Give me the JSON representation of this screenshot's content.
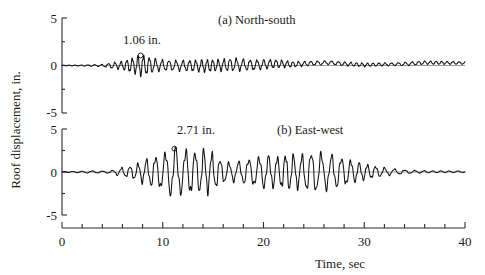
{
  "figure": {
    "y_axis_title": "Roof displacement, in.",
    "x_axis_title": "Time, sec"
  },
  "chart_data": {
    "type": "line",
    "title": "",
    "xlabel": "Time, sec",
    "ylabel": "Roof displacement, in.",
    "xlim": [
      0,
      40
    ],
    "ylim": [
      -5,
      5
    ],
    "xticks": [
      0,
      10,
      20,
      30,
      40
    ],
    "xtick_labels": [
      "0",
      "10",
      "20",
      "30",
      "40"
    ],
    "xminor_step": 2,
    "yticks": [
      -5,
      0,
      5
    ],
    "ytick_labels": [
      "-5",
      "0",
      "5"
    ],
    "yminor_step": 2.5,
    "grid": false,
    "legend": "none",
    "panels": [
      {
        "id": "panel-a",
        "title": "(a) North-south",
        "annotation": {
          "text": "1.06 in.",
          "peak_time": 7.8,
          "peak_value": 1.06,
          "marker": "open-circle"
        },
        "envelope": [
          {
            "t": 0.0,
            "a": 0.03
          },
          {
            "t": 2.0,
            "a": 0.05
          },
          {
            "t": 4.0,
            "a": 0.1
          },
          {
            "t": 5.0,
            "a": 0.28
          },
          {
            "t": 6.0,
            "a": 0.4
          },
          {
            "t": 7.0,
            "a": 0.72
          },
          {
            "t": 7.8,
            "a": 1.06
          },
          {
            "t": 8.6,
            "a": 0.82
          },
          {
            "t": 9.5,
            "a": 0.55
          },
          {
            "t": 11.0,
            "a": 0.48
          },
          {
            "t": 12.5,
            "a": 0.52
          },
          {
            "t": 14.0,
            "a": 0.6
          },
          {
            "t": 15.5,
            "a": 0.55
          },
          {
            "t": 17.0,
            "a": 0.62
          },
          {
            "t": 18.5,
            "a": 0.5
          },
          {
            "t": 20.0,
            "a": 0.45
          },
          {
            "t": 21.5,
            "a": 0.38
          },
          {
            "t": 23.0,
            "a": 0.26
          },
          {
            "t": 25.0,
            "a": 0.2
          },
          {
            "t": 27.0,
            "a": 0.17
          },
          {
            "t": 29.0,
            "a": 0.19
          },
          {
            "t": 31.0,
            "a": 0.16
          },
          {
            "t": 33.0,
            "a": 0.14
          },
          {
            "t": 35.0,
            "a": 0.17
          },
          {
            "t": 37.0,
            "a": 0.15
          },
          {
            "t": 40.0,
            "a": 0.12
          }
        ],
        "drift": [
          {
            "t": 0.0,
            "d": 0.0
          },
          {
            "t": 5.0,
            "d": 0.0
          },
          {
            "t": 10.0,
            "d": 0.02
          },
          {
            "t": 14.0,
            "d": -0.05
          },
          {
            "t": 17.0,
            "d": 0.1
          },
          {
            "t": 19.0,
            "d": 0.04
          },
          {
            "t": 21.0,
            "d": 0.18
          },
          {
            "t": 23.0,
            "d": 0.12
          },
          {
            "t": 25.0,
            "d": 0.24
          },
          {
            "t": 26.5,
            "d": 0.3
          },
          {
            "t": 28.0,
            "d": 0.18
          },
          {
            "t": 30.0,
            "d": 0.06
          },
          {
            "t": 32.0,
            "d": 0.12
          },
          {
            "t": 34.0,
            "d": 0.16
          },
          {
            "t": 36.0,
            "d": 0.3
          },
          {
            "t": 38.0,
            "d": 0.28
          },
          {
            "t": 40.0,
            "d": 0.26
          }
        ],
        "period_sec": 0.62,
        "seed": 1734
      },
      {
        "id": "panel-b",
        "title": "(b) East-west",
        "annotation": {
          "text": "2.71 in.",
          "peak_time": 11.15,
          "peak_value": 2.71,
          "marker": "open-circle"
        },
        "envelope": [
          {
            "t": 0.0,
            "a": 0.04
          },
          {
            "t": 2.0,
            "a": 0.08
          },
          {
            "t": 3.0,
            "a": 0.12
          },
          {
            "t": 4.0,
            "a": 0.1
          },
          {
            "t": 5.0,
            "a": 0.16
          },
          {
            "t": 5.8,
            "a": 0.45
          },
          {
            "t": 6.6,
            "a": 0.55
          },
          {
            "t": 7.4,
            "a": 0.85
          },
          {
            "t": 8.2,
            "a": 1.25
          },
          {
            "t": 9.0,
            "a": 1.55
          },
          {
            "t": 9.8,
            "a": 1.8
          },
          {
            "t": 10.5,
            "a": 2.3
          },
          {
            "t": 11.15,
            "a": 2.71
          },
          {
            "t": 11.9,
            "a": 2.25
          },
          {
            "t": 12.6,
            "a": 2.4
          },
          {
            "t": 13.4,
            "a": 2.1
          },
          {
            "t": 14.2,
            "a": 2.45
          },
          {
            "t": 15.0,
            "a": 1.95
          },
          {
            "t": 15.8,
            "a": 1.25
          },
          {
            "t": 16.6,
            "a": 0.95
          },
          {
            "t": 17.4,
            "a": 1.05
          },
          {
            "t": 18.4,
            "a": 1.35
          },
          {
            "t": 19.4,
            "a": 1.55
          },
          {
            "t": 20.4,
            "a": 1.75
          },
          {
            "t": 21.4,
            "a": 1.6
          },
          {
            "t": 22.4,
            "a": 1.95
          },
          {
            "t": 23.4,
            "a": 1.7
          },
          {
            "t": 24.4,
            "a": 2.0
          },
          {
            "t": 25.2,
            "a": 2.15
          },
          {
            "t": 26.2,
            "a": 1.85
          },
          {
            "t": 27.2,
            "a": 1.7
          },
          {
            "t": 28.2,
            "a": 1.4
          },
          {
            "t": 29.2,
            "a": 1.05
          },
          {
            "t": 30.2,
            "a": 0.8
          },
          {
            "t": 31.2,
            "a": 0.58
          },
          {
            "t": 32.2,
            "a": 0.4
          },
          {
            "t": 33.2,
            "a": 0.28
          },
          {
            "t": 34.2,
            "a": 0.18
          },
          {
            "t": 35.5,
            "a": 0.13
          },
          {
            "t": 37.0,
            "a": 0.1
          },
          {
            "t": 40.0,
            "a": 0.08
          }
        ],
        "drift": [
          {
            "t": 0.0,
            "d": 0.0
          },
          {
            "t": 8.0,
            "d": 0.0
          },
          {
            "t": 16.0,
            "d": 0.02
          },
          {
            "t": 24.0,
            "d": 0.0
          },
          {
            "t": 32.0,
            "d": 0.02
          },
          {
            "t": 40.0,
            "d": 0.03
          }
        ],
        "period_sec": 0.92,
        "seed": 9021
      }
    ]
  },
  "colors": {
    "trace": "#111111",
    "axis": "#2b2b2b",
    "zero_line": "#6f6f6f",
    "background": "#ffffff"
  }
}
